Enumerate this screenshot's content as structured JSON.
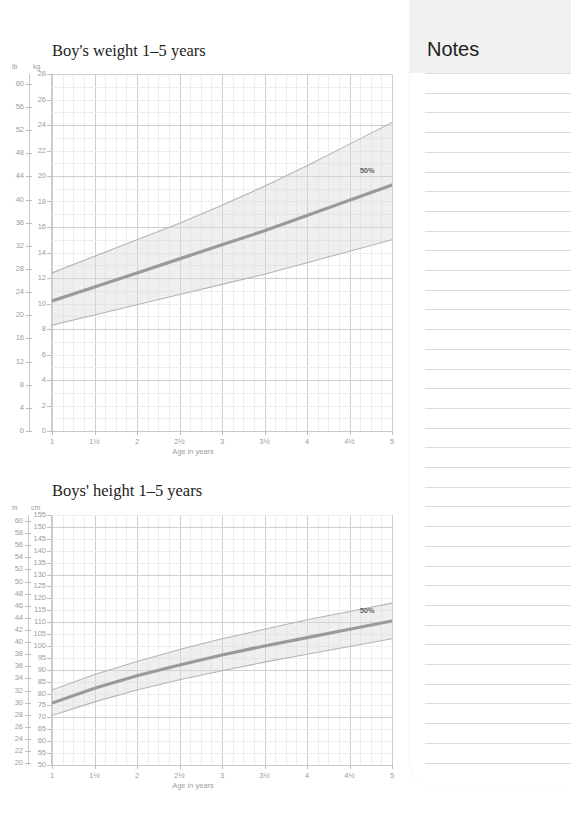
{
  "notes": {
    "title": "Notes",
    "line_count": 36,
    "line_spacing_px": 19.7
  },
  "charts": [
    {
      "id": "weight",
      "title": "Boy's weight 1–5 years",
      "left_unit": "lb",
      "right_unit": "kg",
      "pct_label": "50%",
      "xlabel": "Age in years"
    },
    {
      "id": "height",
      "title": "Boys' height 1–5 years",
      "left_unit": "in",
      "right_unit": "cm",
      "pct_label": "50%",
      "xlabel": "Age in years"
    }
  ],
  "chart_data": [
    {
      "type": "area",
      "id": "weight",
      "title": "Boy's weight 1–5 years",
      "xlabel": "Age in years",
      "ylabel": "kg",
      "y2label": "lb",
      "grid": true,
      "legend": "none",
      "annotations": [
        {
          "text": "50%",
          "x": 4.62,
          "y": 19.6
        }
      ],
      "xlim": [
        1,
        5
      ],
      "xticks": [
        1,
        1.5,
        2,
        2.5,
        3,
        3.5,
        4,
        4.5,
        5
      ],
      "xticklabels": [
        "1",
        "1½",
        "2",
        "2½",
        "3",
        "3½",
        "4",
        "4½",
        "5"
      ],
      "ylim": [
        0,
        28
      ],
      "yticks": [
        0,
        2,
        4,
        6,
        8,
        10,
        12,
        14,
        16,
        18,
        20,
        22,
        24,
        26,
        28
      ],
      "yticklabels": [
        "0",
        "2",
        "4",
        "6",
        "8",
        "10",
        "12",
        "14",
        "16",
        "18",
        "20",
        "22",
        "24",
        "26",
        "28"
      ],
      "y2lim": [
        0,
        61.7
      ],
      "y2ticks": [
        0,
        4,
        8,
        12,
        16,
        20,
        24,
        28,
        32,
        36,
        40,
        44,
        48,
        52,
        56,
        60
      ],
      "y2ticklabels": [
        "0",
        "4",
        "8",
        "12",
        "16",
        "20",
        "24",
        "28",
        "32",
        "36",
        "40",
        "44",
        "48",
        "52",
        "56",
        "60"
      ],
      "x": [
        1,
        1.5,
        2,
        2.5,
        3,
        3.5,
        4,
        4.5,
        5
      ],
      "series": [
        {
          "name": "97th percentile (upper band)",
          "values": [
            12.4,
            13.7,
            15.0,
            16.3,
            17.7,
            19.2,
            20.8,
            22.5,
            24.2
          ]
        },
        {
          "name": "50th percentile (median)",
          "values": [
            10.2,
            11.3,
            12.4,
            13.5,
            14.6,
            15.7,
            16.9,
            18.1,
            19.3
          ]
        },
        {
          "name": "3rd percentile (lower band)",
          "values": [
            8.3,
            9.1,
            9.9,
            10.7,
            11.5,
            12.3,
            13.2,
            14.1,
            15.0
          ]
        }
      ]
    },
    {
      "type": "area",
      "id": "height",
      "title": "Boys' height 1–5 years",
      "xlabel": "Age in years",
      "ylabel": "cm",
      "y2label": "in",
      "grid": true,
      "legend": "none",
      "annotations": [
        {
          "text": "50%",
          "x": 4.62,
          "y": 110.5
        }
      ],
      "xlim": [
        1,
        5
      ],
      "xticks": [
        1,
        1.5,
        2,
        2.5,
        3,
        3.5,
        4,
        4.5,
        5
      ],
      "xticklabels": [
        "1",
        "1½",
        "2",
        "2½",
        "3",
        "3½",
        "4",
        "4½",
        "5"
      ],
      "ylim": [
        50,
        155
      ],
      "yticks": [
        50,
        55,
        60,
        65,
        70,
        75,
        80,
        85,
        90,
        95,
        100,
        105,
        110,
        115,
        120,
        125,
        130,
        135,
        140,
        145,
        150,
        155
      ],
      "yticklabels": [
        "50",
        "55",
        "60",
        "65",
        "70",
        "75",
        "80",
        "85",
        "90",
        "95",
        "100",
        "105",
        "110",
        "115",
        "120",
        "125",
        "130",
        "135",
        "140",
        "145",
        "150",
        "155"
      ],
      "y2lim": [
        19.7,
        61.0
      ],
      "y2ticks": [
        20,
        22,
        24,
        26,
        28,
        30,
        32,
        34,
        36,
        38,
        40,
        42,
        44,
        46,
        48,
        50,
        52,
        54,
        56,
        58,
        60
      ],
      "y2ticklabels": [
        "20",
        "22",
        "24",
        "26",
        "28",
        "30",
        "32",
        "34",
        "36",
        "38",
        "40",
        "42",
        "44",
        "46",
        "48",
        "50",
        "52",
        "54",
        "56",
        "58",
        "60"
      ],
      "x": [
        1,
        1.5,
        2,
        2.5,
        3,
        3.5,
        4,
        4.5,
        5
      ],
      "series": [
        {
          "name": "97th percentile (upper band)",
          "values": [
            81.5,
            88.0,
            93.5,
            98.5,
            103.0,
            107.0,
            111.0,
            114.5,
            118.0
          ]
        },
        {
          "name": "50th percentile (median)",
          "values": [
            76.0,
            82.2,
            87.5,
            92.0,
            96.2,
            100.0,
            103.5,
            107.0,
            110.5
          ]
        },
        {
          "name": "3rd percentile (lower band)",
          "values": [
            70.8,
            76.5,
            81.5,
            85.8,
            89.6,
            93.2,
            96.5,
            99.8,
            103.0
          ]
        }
      ]
    }
  ]
}
